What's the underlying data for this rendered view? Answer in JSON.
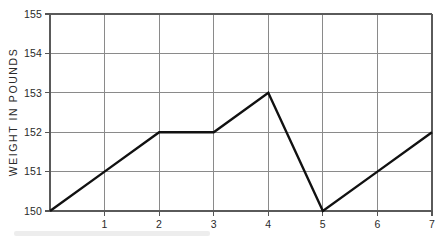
{
  "chart_data": {
    "type": "line",
    "title": "",
    "subtitle": "",
    "xlabel": "",
    "ylabel": "WEIGHT IN POUNDS",
    "x": [
      0,
      1,
      2,
      3,
      4,
      5,
      6,
      7
    ],
    "values": [
      150,
      151,
      152,
      152,
      153,
      150,
      151,
      152
    ],
    "series": [
      {
        "name": "Weight",
        "values": [
          150,
          151,
          152,
          152,
          153,
          150,
          151,
          152
        ]
      }
    ],
    "xlim": [
      0,
      7
    ],
    "ylim": [
      150,
      155
    ],
    "x_tick_labels": [
      "1",
      "2",
      "3",
      "4",
      "5",
      "6",
      "7"
    ],
    "x_tick_values": [
      1,
      2,
      3,
      4,
      5,
      6,
      7
    ],
    "y_tick_labels": [
      "150",
      "151",
      "152",
      "153",
      "154",
      "155"
    ],
    "y_tick_values": [
      150,
      151,
      152,
      153,
      154,
      155
    ],
    "grid": true,
    "legend": false,
    "legend_position": "none",
    "annotations": [],
    "colors": {
      "line": "#111111",
      "grid": "#8a8a8a",
      "frame": "#5a5a5a",
      "text": "#2a2a2a",
      "background": "#ffffff"
    }
  }
}
